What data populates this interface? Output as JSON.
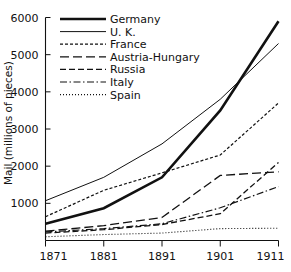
{
  "chart_data": {
    "type": "line",
    "title": "",
    "subtitle": "",
    "xlabel": "",
    "ylabel": "Mail (millions of pieces)",
    "x": [
      1871,
      1881,
      1891,
      1901,
      1911
    ],
    "categories": [
      "1871",
      "1881",
      "1891",
      "1901",
      "1911"
    ],
    "xtick_labels": [
      "1871",
      "1881",
      "1891",
      "1901",
      "1911"
    ],
    "ytick_labels": [
      "1000",
      "2000",
      "3000",
      "4000",
      "5000",
      "6000"
    ],
    "yticks": [
      1000,
      2000,
      3000,
      4000,
      5000,
      6000
    ],
    "xlim": [
      1871,
      1911
    ],
    "ylim": [
      0,
      6000
    ],
    "grid": false,
    "legend_position": "top-left",
    "series": [
      {
        "name": "Germany",
        "style": "solid-thick",
        "color": "#111111",
        "values": [
          450,
          870,
          1700,
          3500,
          5900
        ]
      },
      {
        "name": "U. K.",
        "style": "solid-thin",
        "color": "#111111",
        "values": [
          1070,
          1700,
          2600,
          3800,
          5300
        ]
      },
      {
        "name": "France",
        "style": "fine-dash",
        "color": "#111111",
        "values": [
          640,
          1350,
          1820,
          2300,
          3700
        ]
      },
      {
        "name": "Austria-Hungary",
        "style": "long-dash",
        "color": "#111111",
        "values": [
          250,
          400,
          620,
          1750,
          1850
        ]
      },
      {
        "name": "Russia",
        "style": "medium-dash",
        "color": "#111111",
        "values": [
          200,
          290,
          430,
          720,
          2100
        ]
      },
      {
        "name": "Italy",
        "style": "dash-dot",
        "color": "#111111",
        "values": [
          230,
          320,
          450,
          880,
          1450
        ]
      },
      {
        "name": "Spain",
        "style": "dotted",
        "color": "#111111",
        "values": [
          100,
          160,
          200,
          320,
          330
        ]
      }
    ]
  },
  "legend": {
    "entries": [
      {
        "label": "Germany"
      },
      {
        "label": "U. K."
      },
      {
        "label": "France"
      },
      {
        "label": "Austria-Hungary"
      },
      {
        "label": "Russia"
      },
      {
        "label": "Italy"
      },
      {
        "label": "Spain"
      }
    ]
  },
  "axes": {
    "y_title": "Mail (millions of pieces)",
    "y_ticks": [
      "6000",
      "5000",
      "4000",
      "3000",
      "2000",
      "1000"
    ],
    "x_ticks": [
      "1871",
      "1881",
      "1891",
      "1901",
      "1911"
    ]
  }
}
